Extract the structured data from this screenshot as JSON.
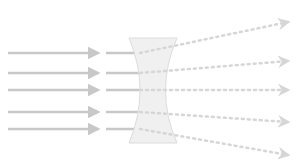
{
  "diagram": {
    "type": "optics-ray-diagram",
    "colors": {
      "background": "#ffffff",
      "incoming_ray": "#c8c8c8",
      "lens_fill": "#f0f0f0",
      "lens_edge": "#dcdcdc",
      "outgoing_ray": "#d6d6d6"
    },
    "lens": {
      "top_y": 38,
      "bottom_y": 143,
      "left_top_x": 129,
      "right_top_x": 177,
      "left_waist_x": 143,
      "right_waist_x": 162
    },
    "incoming_rays": [
      {
        "y": 53
      },
      {
        "y": 73
      },
      {
        "y": 90
      },
      {
        "y": 112
      },
      {
        "y": 129
      }
    ],
    "outgoing_rays": [
      {
        "start_y": 53,
        "end_x": 288,
        "end_y": 22
      },
      {
        "start_y": 73,
        "end_x": 288,
        "end_y": 61
      },
      {
        "start_y": 90,
        "end_x": 288,
        "end_y": 90
      },
      {
        "start_y": 112,
        "end_x": 288,
        "end_y": 122
      },
      {
        "start_y": 129,
        "end_x": 288,
        "end_y": 155
      }
    ]
  }
}
